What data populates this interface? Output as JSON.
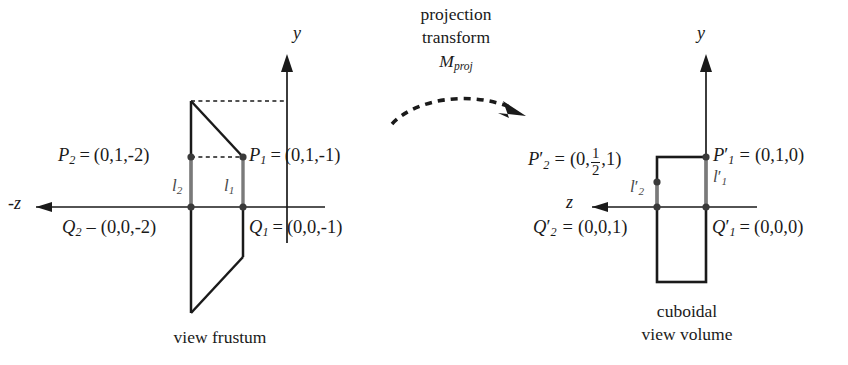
{
  "figure": {
    "background_color": "#ffffff",
    "ink_color": "#1a1a1a",
    "accent_gray": "#6e6e6e",
    "width": 848,
    "height": 365
  },
  "transform_annotation": {
    "line1": "projection",
    "line2": "transform",
    "matrix_symbol": "M",
    "matrix_subscript": "proj",
    "arrow": "dashed-curved-arrow-right"
  },
  "left_diagram": {
    "caption": "view frustum",
    "axes": {
      "vertical_label": "y",
      "horizontal_label": "-z",
      "horizontal_arrow_direction": "left",
      "vertical_arrow_direction": "up"
    },
    "points": [
      {
        "name": "P2",
        "symbol": "P",
        "subscript": "2",
        "prime": false,
        "equals": "=",
        "coords": "(0,1,-2)",
        "full": "P2 = (0,1,-2)"
      },
      {
        "name": "P1",
        "symbol": "P",
        "subscript": "1",
        "prime": false,
        "equals": "=",
        "coords": "(0,1,-1)",
        "full": "P1 = (0,1,-1)"
      },
      {
        "name": "Q2",
        "symbol": "Q",
        "subscript": "2",
        "prime": false,
        "equals": "–",
        "coords": "(0,0,-2)",
        "full": "Q2 – (0,0,-2)"
      },
      {
        "name": "Q1",
        "symbol": "Q",
        "subscript": "1",
        "prime": false,
        "equals": "=",
        "coords": "(0,0,-1)",
        "full": "Q1 = (0,0,-1)"
      }
    ],
    "segments": [
      {
        "name": "l2",
        "symbol": "l",
        "subscript": "2",
        "prime": false
      },
      {
        "name": "l1",
        "symbol": "l",
        "subscript": "1",
        "prime": false
      }
    ]
  },
  "right_diagram": {
    "caption_line1": "cuboidal",
    "caption_line2": "view volume",
    "axes": {
      "vertical_label": "y",
      "horizontal_label": "z",
      "horizontal_arrow_direction": "left",
      "vertical_arrow_direction": "up"
    },
    "points": [
      {
        "name": "P2p",
        "symbol": "P",
        "subscript": "2",
        "prime": true,
        "equals": "=",
        "coords_pre": "(0,",
        "fraction_num": "1",
        "fraction_den": "2",
        "coords_post": ",1)",
        "full": "P'2 = (0,1/2,1)"
      },
      {
        "name": "P1p",
        "symbol": "P",
        "subscript": "1",
        "prime": true,
        "equals": "=",
        "coords": "(0,1,0)",
        "full": "P'1 = (0,1,0)"
      },
      {
        "name": "Q2p",
        "symbol": "Q",
        "subscript": "2",
        "prime": true,
        "equals": "=",
        "coords": "(0,0,1)",
        "full": "Q'2 = (0,0,1)"
      },
      {
        "name": "Q1p",
        "symbol": "Q",
        "subscript": "1",
        "prime": true,
        "equals": "=",
        "coords": "(0,0,0)",
        "full": "Q'1 = (0,0,0)"
      }
    ],
    "segments": [
      {
        "name": "l2p",
        "symbol": "l",
        "subscript": "2",
        "prime": true
      },
      {
        "name": "l1p",
        "symbol": "l",
        "subscript": "1",
        "prime": true
      }
    ]
  }
}
